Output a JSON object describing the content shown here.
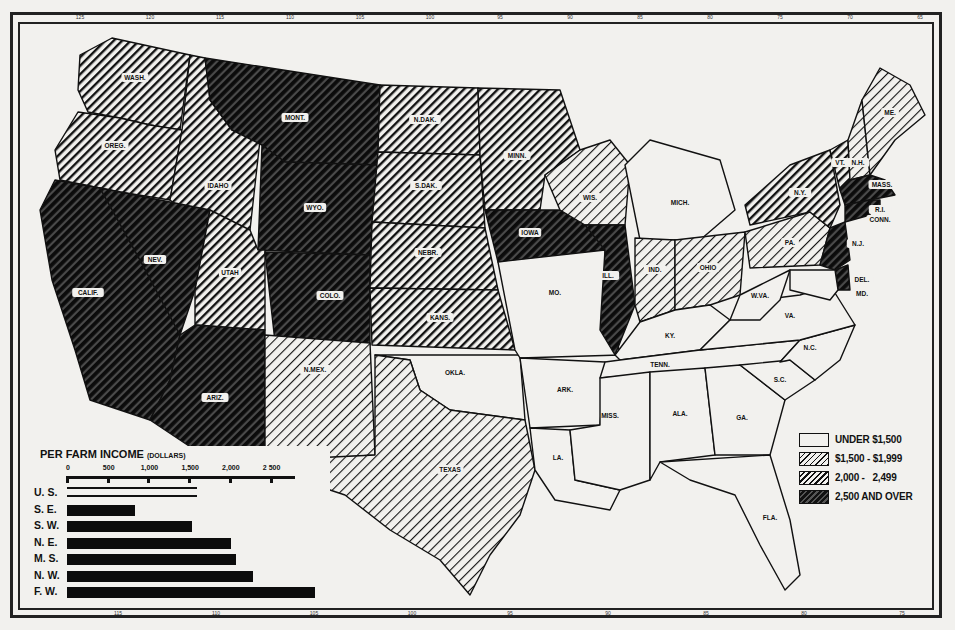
{
  "map": {
    "title": "Per Farm Income by State",
    "top_ticks": [
      "125",
      "120",
      "115",
      "110",
      "105",
      "100",
      "95",
      "90",
      "85",
      "80",
      "75",
      "70",
      "65"
    ],
    "bottom_ticks": [
      "115",
      "110",
      "105",
      "100",
      "95",
      "90",
      "85",
      "80",
      "75",
      "70"
    ],
    "categories": [
      {
        "id": 0,
        "label": "UNDER $1,500"
      },
      {
        "id": 1,
        "label": "$1,500 - $1,999"
      },
      {
        "id": 2,
        "label": "2,000 -   2,499"
      },
      {
        "id": 3,
        "label": "2,500 AND OVER"
      }
    ],
    "states": [
      {
        "name": "WASH.",
        "category": 2
      },
      {
        "name": "OREG.",
        "category": 2
      },
      {
        "name": "IDAHO",
        "category": 2
      },
      {
        "name": "MONT.",
        "category": 3
      },
      {
        "name": "WYO.",
        "category": 3
      },
      {
        "name": "CALIF.",
        "category": 3
      },
      {
        "name": "NEV.",
        "category": 3
      },
      {
        "name": "UTAH",
        "category": 2
      },
      {
        "name": "COLO.",
        "category": 3
      },
      {
        "name": "ARIZ.",
        "category": 3
      },
      {
        "name": "N.MEX.",
        "category": 1
      },
      {
        "name": "N.DAK.",
        "category": 2
      },
      {
        "name": "S.DAK.",
        "category": 2
      },
      {
        "name": "NEBR.",
        "category": 2
      },
      {
        "name": "KANS.",
        "category": 2
      },
      {
        "name": "OKLA.",
        "category": 0
      },
      {
        "name": "TEXAS",
        "category": 1
      },
      {
        "name": "MINN.",
        "category": 2
      },
      {
        "name": "IOWA",
        "category": 3
      },
      {
        "name": "MO.",
        "category": 0
      },
      {
        "name": "ARK.",
        "category": 0
      },
      {
        "name": "LA.",
        "category": 0
      },
      {
        "name": "WIS.",
        "category": 1
      },
      {
        "name": "ILL.",
        "category": 3
      },
      {
        "name": "MICH.",
        "category": 0
      },
      {
        "name": "IND.",
        "category": 1
      },
      {
        "name": "OHIO",
        "category": 1
      },
      {
        "name": "KY.",
        "category": 0
      },
      {
        "name": "TENN.",
        "category": 0
      },
      {
        "name": "MISS.",
        "category": 0
      },
      {
        "name": "ALA.",
        "category": 0
      },
      {
        "name": "GA.",
        "category": 0
      },
      {
        "name": "FLA.",
        "category": 0
      },
      {
        "name": "S.C.",
        "category": 0
      },
      {
        "name": "N.C.",
        "category": 0
      },
      {
        "name": "VA.",
        "category": 0
      },
      {
        "name": "W.VA.",
        "category": 0
      },
      {
        "name": "PA.",
        "category": 1
      },
      {
        "name": "N.Y.",
        "category": 2
      },
      {
        "name": "VT.",
        "category": 2
      },
      {
        "name": "N.H.",
        "category": 1
      },
      {
        "name": "ME.",
        "category": 1
      },
      {
        "name": "MASS.",
        "category": 3
      },
      {
        "name": "R.I.",
        "category": 3
      },
      {
        "name": "CONN.",
        "category": 3
      },
      {
        "name": "N.J.",
        "category": 3
      },
      {
        "name": "DEL.",
        "category": 3
      },
      {
        "name": "MD.",
        "category": 0
      }
    ]
  },
  "legend": {
    "items": [
      {
        "label": "UNDER $1,500",
        "category": 0
      },
      {
        "label": "$1,500 - $1,999",
        "category": 1
      },
      {
        "label": "2,000 -   2,499",
        "category": 2
      },
      {
        "label": "2,500 AND OVER",
        "category": 3
      }
    ]
  },
  "chart": {
    "title": "PER FARM INCOME",
    "subtitle": "(DOLLARS)"
  },
  "chart_data": {
    "type": "bar",
    "orientation": "horizontal",
    "title": "PER FARM INCOME (DOLLARS)",
    "xlabel": "Dollars",
    "ylabel": "",
    "categories": [
      "U. S.",
      "S. E.",
      "S. W.",
      "N. E.",
      "M. S.",
      "N. W.",
      "F. W."
    ],
    "values": [
      1600,
      840,
      1540,
      2010,
      2070,
      2290,
      3040
    ],
    "x_ticks": [
      0,
      500,
      1000,
      1500,
      2000,
      2500
    ],
    "x_tick_labels": [
      "0",
      "500",
      "1,000",
      "1,500",
      "2,000",
      "2 500"
    ],
    "xlim": [
      0,
      3100
    ],
    "grid": false,
    "legend": "none"
  }
}
